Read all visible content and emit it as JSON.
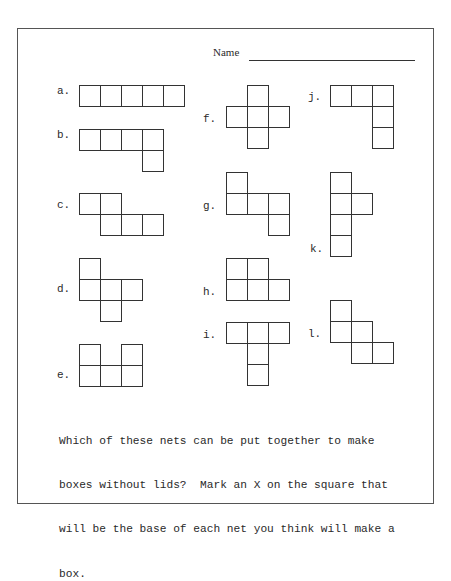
{
  "worksheet": {
    "name_label": "Name",
    "instructions_lines": [
      "Which of these nets can be put together to make",
      "boxes without lids?  Mark an X on the square that",
      "will be the base of each net you think will make a",
      "box."
    ],
    "square_size_px": 21,
    "nets": [
      {
        "label": "a.",
        "label_pos": [
          57,
          94
        ],
        "origin": [
          79,
          85
        ],
        "cells": [
          [
            0,
            0
          ],
          [
            1,
            0
          ],
          [
            2,
            0
          ],
          [
            3,
            0
          ],
          [
            4,
            0
          ]
        ]
      },
      {
        "label": "b.",
        "label_pos": [
          57,
          138
        ],
        "origin": [
          79,
          129
        ],
        "cells": [
          [
            0,
            0
          ],
          [
            1,
            0
          ],
          [
            2,
            0
          ],
          [
            3,
            0
          ],
          [
            3,
            1
          ]
        ]
      },
      {
        "label": "c.",
        "label_pos": [
          57,
          208
        ],
        "origin": [
          79,
          193
        ],
        "cells": [
          [
            0,
            0
          ],
          [
            1,
            0
          ],
          [
            1,
            1
          ],
          [
            2,
            1
          ],
          [
            3,
            1
          ]
        ]
      },
      {
        "label": "d.",
        "label_pos": [
          57,
          292
        ],
        "origin": [
          79,
          258
        ],
        "cells": [
          [
            0,
            0
          ],
          [
            0,
            1
          ],
          [
            1,
            1
          ],
          [
            2,
            1
          ],
          [
            1,
            2
          ]
        ]
      },
      {
        "label": "e.",
        "label_pos": [
          57,
          378
        ],
        "origin": [
          79,
          344
        ],
        "cells": [
          [
            0,
            0
          ],
          [
            2,
            0
          ],
          [
            0,
            1
          ],
          [
            1,
            1
          ],
          [
            2,
            1
          ]
        ]
      },
      {
        "label": "f.",
        "label_pos": [
          203,
          122
        ],
        "origin": [
          226,
          85
        ],
        "cells": [
          [
            1,
            0
          ],
          [
            0,
            1
          ],
          [
            1,
            1
          ],
          [
            2,
            1
          ],
          [
            1,
            2
          ]
        ]
      },
      {
        "label": "g.",
        "label_pos": [
          203,
          209
        ],
        "origin": [
          226,
          172
        ],
        "cells": [
          [
            0,
            0
          ],
          [
            0,
            1
          ],
          [
            1,
            1
          ],
          [
            2,
            1
          ],
          [
            2,
            2
          ]
        ]
      },
      {
        "label": "h.",
        "label_pos": [
          203,
          295
        ],
        "origin": [
          226,
          258
        ],
        "cells": [
          [
            0,
            0
          ],
          [
            1,
            0
          ],
          [
            0,
            1
          ],
          [
            1,
            1
          ],
          [
            2,
            1
          ]
        ]
      },
      {
        "label": "i.",
        "label_pos": [
          203,
          338
        ],
        "origin": [
          226,
          322
        ],
        "cells": [
          [
            0,
            0
          ],
          [
            1,
            0
          ],
          [
            2,
            0
          ],
          [
            1,
            1
          ],
          [
            1,
            2
          ]
        ]
      },
      {
        "label": "j.",
        "label_pos": [
          308,
          100
        ],
        "origin": [
          330,
          85
        ],
        "cells": [
          [
            0,
            0
          ],
          [
            1,
            0
          ],
          [
            2,
            0
          ],
          [
            2,
            1
          ],
          [
            2,
            2
          ]
        ]
      },
      {
        "label": "k.",
        "label_pos": [
          310,
          252
        ],
        "origin": [
          330,
          172
        ],
        "cells": [
          [
            0,
            0
          ],
          [
            0,
            1
          ],
          [
            1,
            1
          ],
          [
            0,
            2
          ],
          [
            0,
            3
          ]
        ]
      },
      {
        "label": "l.",
        "label_pos": [
          308,
          337
        ],
        "origin": [
          330,
          300
        ],
        "cells": [
          [
            0,
            0
          ],
          [
            0,
            1
          ],
          [
            1,
            1
          ],
          [
            1,
            2
          ],
          [
            2,
            2
          ]
        ]
      }
    ]
  }
}
